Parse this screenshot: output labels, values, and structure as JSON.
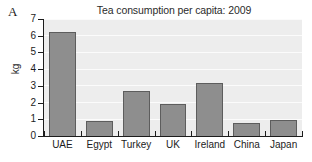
{
  "panel": {
    "label": "A"
  },
  "axis": {
    "y_title": "kg",
    "y_ticks": [
      "0",
      "1",
      "2",
      "3",
      "4",
      "5",
      "6",
      "7"
    ]
  },
  "colors": {
    "bar_fill": "#8e8e8e",
    "bar_edge": "#5d5d5d",
    "plot_background": "#ededed",
    "gridline": "#fbfbfb",
    "axis": "#1c1c1c",
    "text": "#2b2b2b"
  },
  "chart_data": {
    "type": "bar",
    "title": "Tea consumption per capita: 2009",
    "xlabel": "",
    "ylabel": "kg",
    "categories": [
      "UAE",
      "Egypt",
      "Turkey",
      "UK",
      "Ireland",
      "China",
      "Japan"
    ],
    "values": [
      6.2,
      0.9,
      2.7,
      1.9,
      3.2,
      0.8,
      0.95
    ],
    "ylim": [
      0,
      7
    ],
    "ytick_values": [
      0,
      1,
      2,
      3,
      4,
      5,
      6,
      7
    ],
    "grid": true,
    "legend": null
  }
}
